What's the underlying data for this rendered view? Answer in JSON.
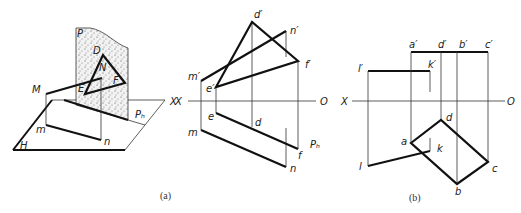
{
  "figure_a_3d": {
    "plane_label": "P",
    "points": [
      "D",
      "N",
      "E",
      "F",
      "M"
    ],
    "projections": [
      "m",
      "n"
    ],
    "horizontal_plane_label": "H",
    "trace_label": "Pₕ",
    "axis_label": "X"
  },
  "figure_a_proj": {
    "upper": [
      "d′",
      "n′",
      "f′",
      "m′",
      "e′"
    ],
    "lower": [
      "e",
      "d",
      "m",
      "f",
      "n"
    ],
    "trace_label": "Pₕ",
    "axis_left": "X",
    "axis_right": "O"
  },
  "figure_b": {
    "upper": [
      "a′",
      "d′",
      "b′",
      "c′",
      "l′",
      "k′"
    ],
    "lower": [
      "a",
      "d",
      "k",
      "l",
      "c",
      "b"
    ],
    "axis_left": "X",
    "axis_right": "O"
  },
  "captions": {
    "a": "(a)",
    "b": "(b)"
  }
}
